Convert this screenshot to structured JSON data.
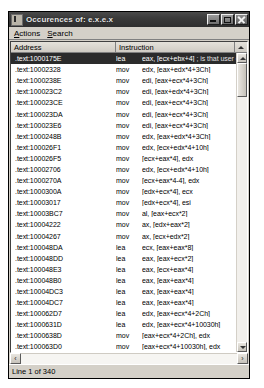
{
  "window": {
    "title": "Occurences of: e.x.e.x",
    "icon": "app-icon",
    "controls": {
      "minimize": "_",
      "maximize": "□",
      "close": "✕"
    }
  },
  "menubar": {
    "items": [
      {
        "label": "Actions",
        "accel": "A"
      },
      {
        "label": "Search",
        "accel": "S"
      }
    ]
  },
  "columns": {
    "address": "Address",
    "instruction": "Instruction"
  },
  "rows": [
    {
      "address": ".text:1000175E",
      "mnemonic": "lea",
      "operands": "eax, [ecx+ebx+4]",
      "comment": "; is that user controlled?",
      "selected": true
    },
    {
      "address": ".text:10002328",
      "mnemonic": "mov",
      "operands": "edx, [eax+edx*4+3Ch]",
      "comment": "",
      "selected": false
    },
    {
      "address": ".text:1000238E",
      "mnemonic": "mov",
      "operands": "edi, [eax+ecx*4+3Ch]",
      "comment": "",
      "selected": false
    },
    {
      "address": ".text:100023C2",
      "mnemonic": "mov",
      "operands": "edi, [eax+edx*4+3Ch]",
      "comment": "",
      "selected": false
    },
    {
      "address": ".text:100023CE",
      "mnemonic": "mov",
      "operands": "edi, [eax+ecx*4+3Ch]",
      "comment": "",
      "selected": false
    },
    {
      "address": ".text:100023DA",
      "mnemonic": "mov",
      "operands": "edi, [eax+ecx*4+3Ch]",
      "comment": "",
      "selected": false
    },
    {
      "address": ".text:100023E6",
      "mnemonic": "mov",
      "operands": "edi, [eax+ecx*4+3Ch]",
      "comment": "",
      "selected": false
    },
    {
      "address": ".text:1000248B",
      "mnemonic": "mov",
      "operands": "edx, [eax+edx*4+3Ch]",
      "comment": "",
      "selected": false
    },
    {
      "address": ".text:100026F1",
      "mnemonic": "mov",
      "operands": "edx, [ecx+edx*4+10h]",
      "comment": "",
      "selected": false
    },
    {
      "address": ".text:100026F5",
      "mnemonic": "mov",
      "operands": "[ecx+eax*4], edx",
      "comment": "",
      "selected": false
    },
    {
      "address": ".text:10002706",
      "mnemonic": "mov",
      "operands": "edx, [ecx+edx*4+10h]",
      "comment": "",
      "selected": false
    },
    {
      "address": ".text:1000270A",
      "mnemonic": "mov",
      "operands": "[ecx+eax*4-4], edx",
      "comment": "",
      "selected": false
    },
    {
      "address": ".text:1000300A",
      "mnemonic": "mov",
      "operands": "[edx+ecx*4], ecx",
      "comment": "",
      "selected": false
    },
    {
      "address": ".text:10003017",
      "mnemonic": "mov",
      "operands": "[edx+ecx*4], esi",
      "comment": "",
      "selected": false
    },
    {
      "address": ".text:10003BC7",
      "mnemonic": "mov",
      "operands": "al, [eax+ecx*2]",
      "comment": "",
      "selected": false
    },
    {
      "address": ".text:10004222",
      "mnemonic": "mov",
      "operands": "ax, [edx+eax*2]",
      "comment": "",
      "selected": false
    },
    {
      "address": ".text:10004267",
      "mnemonic": "mov",
      "operands": "ax, [ecx+edx*2]",
      "comment": "",
      "selected": false
    },
    {
      "address": ".text:100048DA",
      "mnemonic": "lea",
      "operands": "ecx, [eax+eax*8]",
      "comment": "",
      "selected": false
    },
    {
      "address": ".text:100048DD",
      "mnemonic": "lea",
      "operands": "eax, [eax+ecx*2]",
      "comment": "",
      "selected": false
    },
    {
      "address": ".text:100048E3",
      "mnemonic": "lea",
      "operands": "eax, [ecx+eax*4]",
      "comment": "",
      "selected": false
    },
    {
      "address": ".text:100048B0",
      "mnemonic": "lea",
      "operands": "eax, [eax+eax*4]",
      "comment": "",
      "selected": false
    },
    {
      "address": ".text:10004DC3",
      "mnemonic": "lea",
      "operands": "eax, [eax+eax*4]",
      "comment": "",
      "selected": false
    },
    {
      "address": ".text:10004DC7",
      "mnemonic": "lea",
      "operands": "eax, [eax+eax*4]",
      "comment": "",
      "selected": false
    },
    {
      "address": ".text:100062D7",
      "mnemonic": "lea",
      "operands": "edx, [eax+ecx*4+2Ch]",
      "comment": "",
      "selected": false
    },
    {
      "address": ".text:1000631D",
      "mnemonic": "lea",
      "operands": "edx, [eax+ecx*4+10030h]",
      "comment": "",
      "selected": false
    },
    {
      "address": ".text:1000638D",
      "mnemonic": "mov",
      "operands": "[eax+ecx*4+2Ch], edx",
      "comment": "",
      "selected": false
    },
    {
      "address": ".text:100063D0",
      "mnemonic": "mov",
      "operands": "[eax+ecx*4+10030h], edx",
      "comment": "",
      "selected": false
    },
    {
      "address": ".text:1000A53C",
      "mnemonic": "lea",
      "operands": "eax, [eax+eax*4]",
      "comment": "",
      "selected": false
    },
    {
      "address": ".text:1000A53F",
      "mnemonic": "lea",
      "operands": "eax, [eax+eax*4]",
      "comment": "",
      "selected": false
    },
    {
      "address": ".text:1000A542",
      "mnemonic": "lea",
      "operands": "eax, [eax+eax*4]",
      "comment": "",
      "selected": false
    },
    {
      "address": ".text:1000A545",
      "mnemonic": "lea",
      "operands": "eax, [eax+eax*4]",
      "comment": "",
      "selected": false
    },
    {
      "address": ".text:1000A548",
      "mnemonic": "lea",
      "operands": "eax, [eax+eax*4]",
      "comment": "",
      "selected": false
    },
    {
      "address": ".text:1000A54B",
      "mnemonic": "lea",
      "operands": "eax, [eax+eax*4]",
      "comment": "",
      "selected": false
    }
  ],
  "hscroll": {
    "left_arrow": "‹",
    "right_arrow": "›"
  },
  "statusbar": {
    "text": "Line 1 of 340"
  },
  "colors": {
    "window_face": "#d4d0c8",
    "selection": "#2b2b2b",
    "title_bar": "#3a3a3a",
    "list_background": "#ffffff"
  }
}
